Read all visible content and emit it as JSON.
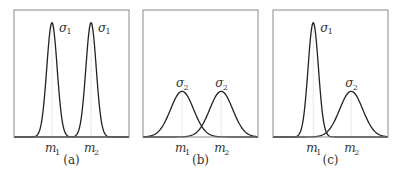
{
  "panels": [
    {
      "caption": "(a)",
      "curves": [
        {
          "mean": "m1",
          "sigma": "σ1",
          "label": "σ",
          "label_sub": "1",
          "center": 0.33,
          "width": 0.045,
          "height": 0.9
        },
        {
          "mean": "m2",
          "sigma": "σ1",
          "label": "σ",
          "label_sub": "1",
          "center": 0.67,
          "width": 0.045,
          "height": 0.9
        }
      ],
      "ticks": [
        {
          "label": "m",
          "sub": "1",
          "pos": 0.33
        },
        {
          "label": "m",
          "sub": "2",
          "pos": 0.67
        }
      ]
    },
    {
      "caption": "(b)",
      "curves": [
        {
          "mean": "m1",
          "sigma": "σ2",
          "label": "σ",
          "label_sub": "2",
          "center": 0.34,
          "width": 0.1,
          "height": 0.36
        },
        {
          "mean": "m2",
          "sigma": "σ2",
          "label": "σ",
          "label_sub": "2",
          "center": 0.68,
          "width": 0.1,
          "height": 0.36
        }
      ],
      "ticks": [
        {
          "label": "m",
          "sub": "1",
          "pos": 0.34
        },
        {
          "label": "m",
          "sub": "2",
          "pos": 0.68
        }
      ]
    },
    {
      "caption": "(c)",
      "curves": [
        {
          "mean": "m1",
          "sigma": "σ1",
          "label": "σ",
          "label_sub": "1",
          "center": 0.35,
          "width": 0.045,
          "height": 0.9
        },
        {
          "mean": "m2",
          "sigma": "σ2",
          "label": "σ",
          "label_sub": "2",
          "center": 0.68,
          "width": 0.1,
          "height": 0.36
        }
      ],
      "ticks": [
        {
          "label": "m",
          "sub": "1",
          "pos": 0.35
        },
        {
          "label": "m",
          "sub": "2",
          "pos": 0.68
        }
      ]
    }
  ]
}
